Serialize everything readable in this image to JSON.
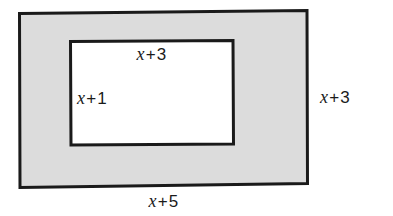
{
  "figure": {
    "type": "geometry-diagram",
    "background_color": "#ffffff",
    "outer_rectangle": {
      "name": "outer-rectangle",
      "fill_color": "#dcdcdc",
      "stroke_color": "#1a1a1a",
      "stroke_width": 3
    },
    "inner_rectangle": {
      "name": "inner-rectangle",
      "fill_color": "#ffffff",
      "stroke_color": "#1a1a1a",
      "stroke_width": 3
    }
  },
  "labels": {
    "inner_top": {
      "variable": "x",
      "operator": "+",
      "constant": "3",
      "full": "x + 3",
      "position": "inner-rectangle-top"
    },
    "inner_left": {
      "variable": "x",
      "operator": "+",
      "constant": "1",
      "full": "x + 1",
      "position": "inner-rectangle-left"
    },
    "outer_right": {
      "variable": "x",
      "operator": "+",
      "constant": "3",
      "full": "x + 3",
      "position": "outer-rectangle-right"
    },
    "outer_bottom": {
      "variable": "x",
      "operator": "+",
      "constant": "5",
      "full": "x + 5",
      "position": "outer-rectangle-bottom"
    }
  }
}
